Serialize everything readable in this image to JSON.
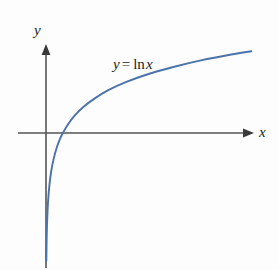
{
  "figure": {
    "background_color": "#fdfdfd",
    "axis_color": "#555555",
    "curve_color": "#4a72ab",
    "text_color": "#1d1d1d",
    "y_axis_label": "y",
    "x_axis_label": "x",
    "equation": {
      "lhs": "y",
      "operator": "=",
      "function": "ln",
      "argument": "x",
      "full_text": "y = ln x"
    }
  },
  "chart_data": {
    "type": "line",
    "title": "",
    "subtitle": "",
    "xlabel": "x",
    "ylabel": "y",
    "annotations": [
      "y = ln x"
    ],
    "legend": [],
    "legend_position": "none",
    "grid": false,
    "axis_arrows": {
      "x": "right",
      "y": "up"
    },
    "origin_px": {
      "x": 46,
      "y": 133
    },
    "x_intercept": 1,
    "vertical_asymptote": 0,
    "xlim": [
      0,
      12
    ],
    "ylim": [
      -4.2,
      2.6
    ],
    "tick_labels": {
      "x": [],
      "y": []
    },
    "series": [
      {
        "name": "y = ln x",
        "color": "#4a72ab",
        "x": [
          0.02,
          0.04,
          0.06,
          0.09,
          0.13,
          0.2,
          0.3,
          0.45,
          0.65,
          0.85,
          1.0,
          1.3,
          1.7,
          2.2,
          2.9,
          3.7,
          4.7,
          6.0,
          7.5,
          9.2,
          11.0,
          12.2
        ],
        "y": [
          -3.91,
          -3.22,
          -2.81,
          -2.41,
          -2.04,
          -1.61,
          -1.2,
          -0.8,
          -0.43,
          -0.16,
          0.0,
          0.26,
          0.53,
          0.79,
          1.06,
          1.31,
          1.55,
          1.79,
          2.01,
          2.22,
          2.4,
          2.5
        ]
      }
    ]
  }
}
